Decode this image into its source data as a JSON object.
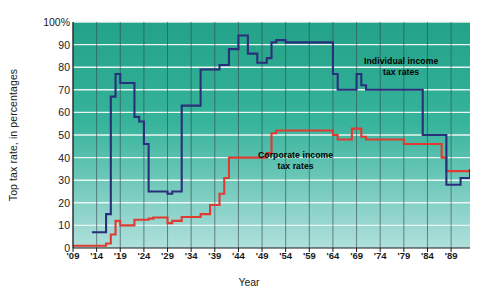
{
  "chart_data": {
    "type": "line",
    "title": "",
    "xlabel": "Year",
    "ylabel": "Top tax rate, in percentages",
    "ylim": [
      0,
      100
    ],
    "xlim": [
      1909,
      1993
    ],
    "grid": true,
    "legend_position": "inline-annotation",
    "y_ticks": [
      "0",
      "10",
      "20",
      "30",
      "40",
      "50",
      "60",
      "70",
      "80",
      "90",
      "100%"
    ],
    "y_tick_values": [
      0,
      10,
      20,
      30,
      40,
      50,
      60,
      70,
      80,
      90,
      100
    ],
    "x_ticks": [
      "'09",
      "'14",
      "'19",
      "'24",
      "'29",
      "'34",
      "'39",
      "'44",
      "'49",
      "'54",
      "'59",
      "'64",
      "'69",
      "'74",
      "'79",
      "'84",
      "'89"
    ],
    "x_tick_values": [
      1909,
      1914,
      1919,
      1924,
      1929,
      1934,
      1939,
      1944,
      1949,
      1954,
      1959,
      1964,
      1969,
      1974,
      1979,
      1984,
      1989
    ],
    "colors": {
      "individual": "#2b2f7a",
      "corporate": "#e03a31",
      "plot_bg_top": "#26a68a",
      "plot_bg_bottom": "#a8ddd9",
      "gridline": "#e8f5f2",
      "axis": "#1a1a1a"
    },
    "series": [
      {
        "name": "Individual income tax rates",
        "color": "#2b2f7a",
        "x": [
          1913,
          1915,
          1916,
          1917,
          1918,
          1919,
          1921,
          1922,
          1923,
          1924,
          1925,
          1929,
          1930,
          1932,
          1936,
          1938,
          1940,
          1941,
          1942,
          1944,
          1945,
          1946,
          1948,
          1950,
          1951,
          1952,
          1954,
          1964,
          1965,
          1968,
          1969,
          1970,
          1971,
          1982,
          1983,
          1987,
          1988,
          1991,
          1993
        ],
        "values": [
          7,
          7,
          15,
          67,
          77,
          73,
          73,
          58,
          56,
          46,
          25,
          24,
          25,
          63,
          79,
          79,
          81,
          81,
          88,
          94,
          94,
          86,
          82,
          84,
          91,
          92,
          91,
          77,
          70,
          70,
          77,
          72,
          70,
          70,
          50,
          50,
          28,
          31,
          35
        ]
      },
      {
        "name": "Corporate income tax rates",
        "color": "#e03a31",
        "x": [
          1909,
          1913,
          1916,
          1917,
          1918,
          1919,
          1922,
          1925,
          1926,
          1929,
          1930,
          1932,
          1936,
          1938,
          1940,
          1941,
          1942,
          1950,
          1951,
          1952,
          1964,
          1965,
          1968,
          1970,
          1971,
          1979,
          1982,
          1987,
          1988,
          1993
        ],
        "values": [
          1,
          1,
          2,
          6,
          12,
          10,
          12.5,
          13,
          13.5,
          11,
          12,
          13.75,
          15,
          19,
          24,
          31,
          40,
          42,
          50.75,
          52,
          50,
          48,
          52.8,
          49.2,
          48,
          46,
          46,
          40,
          34,
          35
        ]
      }
    ],
    "annotations": [
      {
        "id": "individual",
        "text_line1": "Individual income",
        "text_line2": "tax rates"
      },
      {
        "id": "corporate",
        "text_line1": "Corporate income",
        "text_line2": "tax rates"
      }
    ]
  }
}
